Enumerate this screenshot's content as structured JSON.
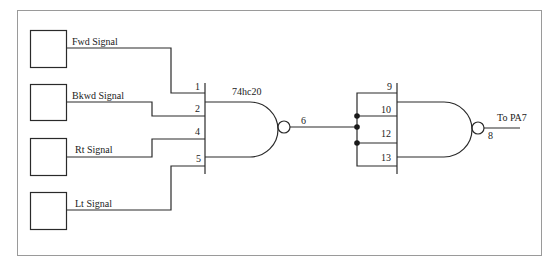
{
  "diagram": {
    "frame_color": "#9a9a9a",
    "line_color": "#2a2a2a",
    "inputs": [
      {
        "label": "Fwd Signal"
      },
      {
        "label": "Bkwd Signal"
      },
      {
        "label": "Rt Signal"
      },
      {
        "label": "Lt Signal"
      }
    ],
    "gate1": {
      "part": "74hc20",
      "type": "NAND",
      "input_pins": [
        "1",
        "2",
        "4",
        "5"
      ],
      "output_pin": "6"
    },
    "gate2": {
      "type": "NAND",
      "input_pins": [
        "9",
        "10",
        "12",
        "13"
      ],
      "output_pin": "8",
      "output_label": "To PA7"
    }
  }
}
